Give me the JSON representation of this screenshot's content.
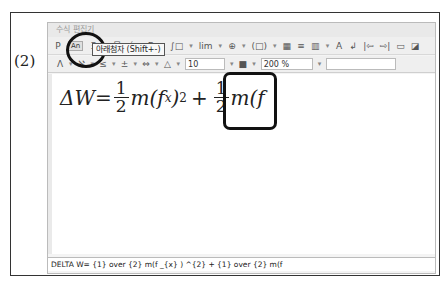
{
  "step_label": "(2)",
  "window": {
    "title": "수식 편집기"
  },
  "toolbar_row1": [
    {
      "name": "superscript-icon",
      "glyph": "P"
    },
    {
      "name": "subscript-button",
      "glyph": "An"
    },
    {
      "name": "script-icon",
      "glyph": "Ξ"
    },
    {
      "name": "dropdown-icon",
      "glyph": "▾"
    },
    {
      "name": "fraction-icon",
      "glyph": "믐"
    },
    {
      "name": "root-icon",
      "glyph": "√ㅁ"
    },
    {
      "name": "sum-icon",
      "glyph": "Σ"
    },
    {
      "name": "dropdown-icon",
      "glyph": "▾"
    },
    {
      "name": "integral-icon",
      "glyph": "∫□"
    },
    {
      "name": "dropdown-icon",
      "glyph": "▾"
    },
    {
      "name": "limit-icon",
      "glyph": "lim"
    },
    {
      "name": "dropdown-icon",
      "glyph": "▾"
    },
    {
      "name": "matrix-cross-icon",
      "glyph": "⊕"
    },
    {
      "name": "dropdown-icon",
      "glyph": "▾"
    },
    {
      "name": "bracket-icon",
      "glyph": "(□)"
    },
    {
      "name": "dropdown-icon",
      "glyph": "▾"
    },
    {
      "name": "matrix-icon",
      "glyph": "▦"
    },
    {
      "name": "align-icon",
      "glyph": "≡"
    },
    {
      "name": "grid-icon",
      "glyph": "▥"
    },
    {
      "name": "dropdown-icon",
      "glyph": "▾"
    },
    {
      "name": "font-icon",
      "glyph": "A"
    },
    {
      "name": "enter-icon",
      "glyph": "↲"
    },
    {
      "name": "prev-icon",
      "glyph": "|⇦"
    },
    {
      "name": "next-icon",
      "glyph": "⇨|"
    },
    {
      "name": "open-icon",
      "glyph": "▭"
    },
    {
      "name": "save-icon",
      "glyph": "◪"
    }
  ],
  "toolbar_row2": {
    "icons": [
      {
        "name": "greek-icon",
        "glyph": "Λ"
      },
      {
        "name": "dropdown-icon",
        "glyph": "▾"
      },
      {
        "name": "symbol-icon",
        "glyph": "ℵ"
      },
      {
        "name": "dropdown-icon",
        "glyph": "▾"
      },
      {
        "name": "relation-icon",
        "glyph": "≤"
      },
      {
        "name": "dropdown-icon",
        "glyph": "▾"
      },
      {
        "name": "operator-icon",
        "glyph": "±"
      },
      {
        "name": "dropdown-icon",
        "glyph": "▾"
      },
      {
        "name": "arrow-icon",
        "glyph": "⇔"
      },
      {
        "name": "dropdown-icon",
        "glyph": "▾"
      },
      {
        "name": "decoration-icon",
        "glyph": "△"
      },
      {
        "name": "dropdown-icon",
        "glyph": "▾"
      }
    ],
    "font_size": "10",
    "color_glyph": "■",
    "zoom": "200 %",
    "extra_field": ""
  },
  "tooltip": "아래첨자 (Shift+-)",
  "formula": {
    "lhs": "ΔW=",
    "frac1_num": "1",
    "frac1_den": "2",
    "term1": "m(f",
    "term1_sub": "x",
    "term1_close": ")",
    "term1_sup": "2",
    "plus": "+",
    "frac2_num": "1",
    "frac2_den": "2",
    "term2": "m(f"
  },
  "script": "DELTA W= {1} over {2} m(f _{x} ) ^{2} + {1} over {2} m(f"
}
